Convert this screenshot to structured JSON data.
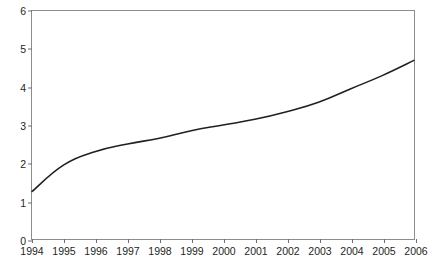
{
  "chart_data": {
    "type": "line",
    "title": "",
    "subtitle": "",
    "xlabel": "",
    "ylabel": "",
    "grid": false,
    "legend": "none",
    "x": [
      1994,
      1995,
      1996,
      1997,
      1998,
      1999,
      2000,
      2001,
      2002,
      2003,
      2004,
      2005,
      2006
    ],
    "categories": [
      "1994",
      "1995",
      "1996",
      "1997",
      "1998",
      "1999",
      "2000",
      "2001",
      "2002",
      "2003",
      "2004",
      "2005",
      "2006"
    ],
    "series": [
      {
        "name": "",
        "values": [
          1.25,
          1.95,
          2.3,
          2.5,
          2.65,
          2.85,
          3.0,
          3.15,
          3.35,
          3.6,
          3.95,
          4.3,
          4.7
        ]
      }
    ],
    "xlim": [
      1994,
      2006
    ],
    "ylim": [
      0,
      6
    ],
    "yticks": [
      0,
      1,
      2,
      3,
      4,
      5,
      6
    ],
    "ytick_labels": [
      "0",
      "1",
      "2",
      "3",
      "4",
      "5",
      "6"
    ],
    "xticks": [
      1994,
      1995,
      1996,
      1997,
      1998,
      1999,
      2000,
      2001,
      2002,
      2003,
      2004,
      2005,
      2006
    ],
    "xtick_labels": [
      "1994",
      "1995",
      "1996",
      "1997",
      "1998",
      "1999",
      "2000",
      "2001",
      "2002",
      "2003",
      "2004",
      "2005",
      "2006"
    ],
    "colors": {
      "line": "#231f20",
      "axis": "#8c8c8c",
      "tick": "#6e6e6e",
      "text": "#231f20",
      "background": "#ffffff"
    }
  }
}
